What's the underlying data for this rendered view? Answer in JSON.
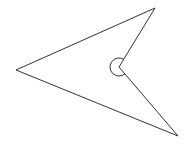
{
  "diagram": {
    "type": "concave-quadrilateral",
    "stroke_color": "#333333",
    "background": "#ffffff",
    "vertices": {
      "left": [
        16,
        70
      ],
      "top": [
        155,
        8
      ],
      "reflex": [
        119,
        67
      ],
      "bottom": [
        178,
        136
      ]
    },
    "reflex_angle_marker": {
      "center": [
        119,
        67
      ],
      "radius": 9
    }
  }
}
